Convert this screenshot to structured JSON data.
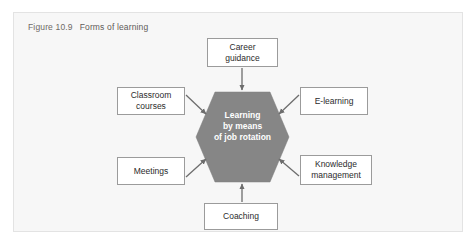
{
  "figure": {
    "label": "Figure 10.9",
    "title": "Forms of learning"
  },
  "colors": {
    "panel_background": "#f7f7f7",
    "panel_border": "#e3e3e3",
    "hexagon_fill": "#868686",
    "hexagon_text": "#ffffff",
    "box_fill": "#ffffff",
    "box_border": "#9b9b9b",
    "box_text": "#2b2b2b",
    "arrow": "#6d6d6d",
    "caption_text": "#6e6a66"
  },
  "diagram": {
    "type": "hub-and-spoke",
    "center": {
      "shape": "hexagon",
      "line1": "Learning",
      "line2": "by means",
      "line3": "of job rotation",
      "full_text": "Learning by means of job rotation"
    },
    "nodes": [
      {
        "id": "career-guidance",
        "line1": "Career",
        "line2": "guidance",
        "position": "top",
        "arrow_direction": "down"
      },
      {
        "id": "classroom-courses",
        "line1": "Classroom",
        "line2": "courses",
        "position": "upper-left",
        "arrow_direction": "down-right"
      },
      {
        "id": "e-learning",
        "line1": "E-learning",
        "line2": "",
        "position": "upper-right",
        "arrow_direction": "down-left"
      },
      {
        "id": "meetings",
        "line1": "Meetings",
        "line2": "",
        "position": "lower-left",
        "arrow_direction": "up-right"
      },
      {
        "id": "knowledge-management",
        "line1": "Knowledge",
        "line2": "management",
        "position": "lower-right",
        "arrow_direction": "up-left"
      },
      {
        "id": "coaching",
        "line1": "Coaching",
        "line2": "",
        "position": "bottom",
        "arrow_direction": "up"
      }
    ]
  }
}
